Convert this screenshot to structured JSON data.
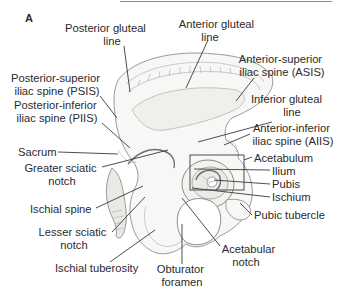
{
  "figure": {
    "panel_label": "A",
    "top_rule_color": "#8a8a8a"
  },
  "labels": {
    "posterior_gluteal_line": [
      "Posterior gluteal",
      "line"
    ],
    "anterior_gluteal_line": [
      "Anterior gluteal",
      "line"
    ],
    "asis": [
      "Anterior-superior",
      "iliac spine (ASIS)"
    ],
    "psis": [
      "Posterior-superior",
      "iliac spine (PSIS)"
    ],
    "inferior_gluteal_line": [
      "Inferior gluteal",
      "line"
    ],
    "piis": [
      "Posterior-inferior",
      "iliac spine (PIIS)"
    ],
    "aiis": [
      "Anterior-inferior",
      "iliac spine (AIIS)"
    ],
    "sacrum": "Sacrum",
    "acetabulum": "Acetabulum",
    "greater_sciatic_notch": [
      "Greater sciatic",
      "notch"
    ],
    "ilium": "Ilium",
    "pubis": "Pubis",
    "ischium": "Ischium",
    "pubic_tubercle": "Pubic tubercle",
    "ischial_spine": "Ischial spine",
    "lesser_sciatic_notch": [
      "Lesser sciatic",
      "notch"
    ],
    "acetabular_notch": [
      "Acetabular",
      "notch"
    ],
    "ischial_tuberosity": "Ischial tuberosity",
    "obturator_foramen": [
      "Obturator",
      "foramen"
    ]
  }
}
